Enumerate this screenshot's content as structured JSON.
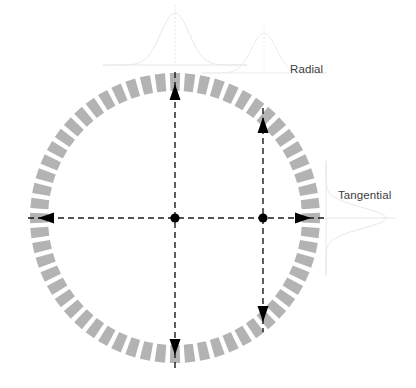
{
  "figure": {
    "title": "",
    "background_color": "#ffffff",
    "width": 416,
    "height": 388
  },
  "labels": {
    "radial": "Radial",
    "tangential": "Tangential"
  },
  "chart_data": {
    "type": "diagram",
    "title": "",
    "subtitle": "",
    "xlabel": "",
    "ylabel": "",
    "grid": false,
    "legend_position": "none",
    "annotations": [
      "Radial",
      "Tangential"
    ],
    "ring": {
      "center": [
        175,
        218
      ],
      "outer_radius": 145,
      "inner_radius": 127,
      "segment_count": 60,
      "segment_fill": "#b3b3b3",
      "segment_gap_degrees": 1.9
    },
    "axes": [
      {
        "name": "vertical-center-axis",
        "orientation": "vertical",
        "x": 175,
        "y_start": 72,
        "y_end": 368,
        "style": "dashed",
        "color": "#1a1a1a"
      },
      {
        "name": "horizontal-center-axis",
        "orientation": "horizontal",
        "y": 218,
        "x_start": 28,
        "x_end": 326,
        "style": "dashed",
        "color": "#1a1a1a"
      },
      {
        "name": "vertical-offset-axis",
        "orientation": "vertical",
        "x": 263,
        "y_start": 108,
        "y_end": 332,
        "style": "dashed",
        "color": "#1a1a1a"
      }
    ],
    "markers": [
      {
        "name": "center-point",
        "x": 175,
        "y": 218,
        "shape": "dot",
        "color": "#000000"
      },
      {
        "name": "offset-point",
        "x": 263,
        "y": 218,
        "shape": "dot",
        "color": "#000000"
      }
    ],
    "arrows": [
      {
        "name": "radial-arrow-up",
        "x": 175,
        "y": 84,
        "direction": "up",
        "axis": "radial"
      },
      {
        "name": "radial-arrow-down",
        "x": 175,
        "y": 355,
        "direction": "down",
        "axis": "radial"
      },
      {
        "name": "tangential-arrow-left",
        "x": 38,
        "y": 218,
        "direction": "left",
        "axis": "tangential"
      },
      {
        "name": "tangential-arrow-right",
        "x": 311,
        "y": 218,
        "direction": "right",
        "axis": "tangential"
      },
      {
        "name": "offset-arrow-up",
        "x": 263,
        "y": 117,
        "direction": "up",
        "axis": "radial"
      },
      {
        "name": "offset-arrow-down",
        "x": 263,
        "y": 322,
        "direction": "down",
        "axis": "radial"
      }
    ],
    "distribution_curves": [
      {
        "name": "radial-distribution-center",
        "orientation": "vertical-peak",
        "center_x": 175,
        "baseline_y": 65,
        "peak_height": 52,
        "half_width": 30,
        "color": "#e8e8e8"
      },
      {
        "name": "radial-distribution-offset",
        "orientation": "vertical-peak",
        "center_x": 264,
        "baseline_y": 73,
        "peak_height": 40,
        "half_width": 26,
        "color": "#ececec"
      },
      {
        "name": "tangential-distribution",
        "orientation": "horizontal-peak",
        "center_y": 218,
        "baseline_x": 326,
        "peak_width": 60,
        "half_height": 22,
        "color": "#e8e8e8"
      }
    ]
  }
}
